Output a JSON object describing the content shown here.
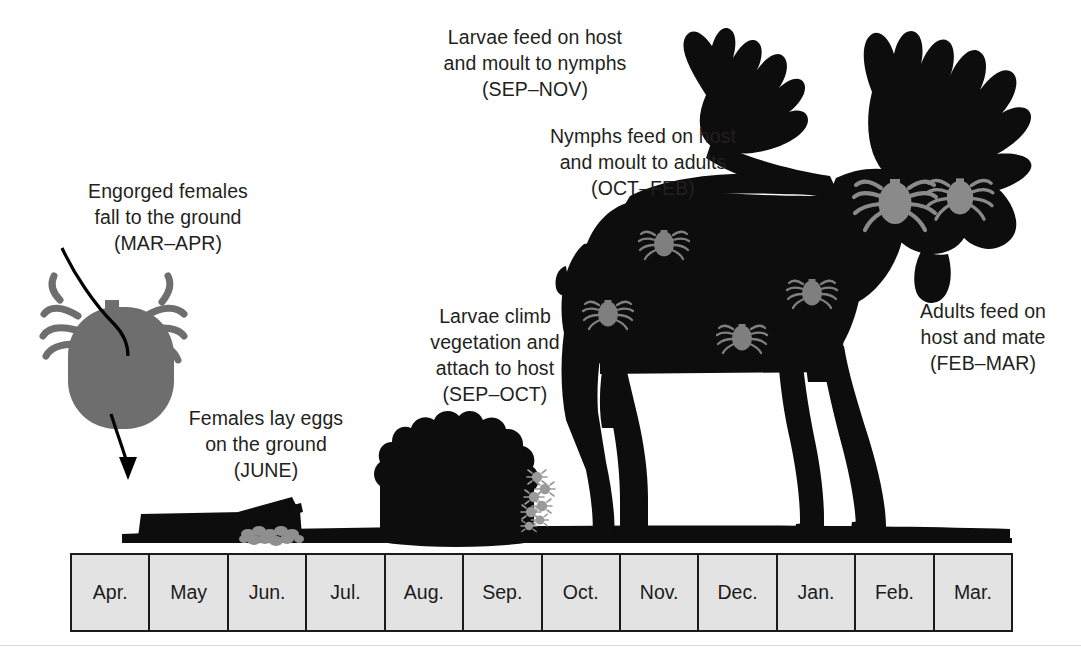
{
  "figure": {
    "background_color": "#ffffff",
    "silhouette_color": "#0d0d0d",
    "tick_color": "#7f7f7f",
    "timeline_fill": "#e3e3e3",
    "timeline_border": "#1b1b1b",
    "text_color": "#231f20"
  },
  "captions": {
    "larvae_feed": "Larvae feed on host\nand moult to nymphs\n(SEP–NOV)",
    "nymphs_feed": "Nymphs feed on host\nand moult to adults\n(OCT–FEB)",
    "engorged_females": "Engorged females\nfall to the ground\n(MAR–APR)",
    "adults_feed": "Adults feed on\nhost and mate\n(FEB–MAR)",
    "larvae_climb": "Larvae climb\nvegetation and\nattach to host\n(SEP–OCT)",
    "females_lay_eggs": "Females lay eggs\non the ground\n(JUNE)"
  },
  "timeline": {
    "months": [
      "Apr.",
      "May",
      "Jun.",
      "Jul.",
      "Aug.",
      "Sep.",
      "Oct.",
      "Nov.",
      "Dec.",
      "Jan.",
      "Feb.",
      "Mar."
    ]
  },
  "illustrations": {
    "engorged_tick": "large-gray-engorged-tick",
    "fall_arrow": "curved-downward-arrow",
    "log": "black-fallen-log",
    "egg_mass": "gray-tick-egg-cluster",
    "bush": "black-shrub-silhouette",
    "climbing_larvae": "gray-larvae-on-vegetation",
    "moose": "black-moose-silhouette",
    "ground": "black-ground-line",
    "body_ticks_count": 4,
    "neck_ticks_count": 2
  }
}
